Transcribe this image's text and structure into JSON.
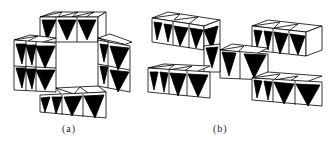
{
  "figure": {
    "panels": [
      {
        "id": "a",
        "caption": "(a)",
        "description": "Ring of edge/corner-sharing octahedra enclosing a square tunnel",
        "colors": {
          "dark_face": "#000000",
          "light_face": "#ffffff",
          "edge": "#000000"
        }
      },
      {
        "id": "b",
        "caption": "(b)",
        "description": "Four layered octahedral slabs linked by a central chain of octahedra",
        "colors": {
          "dark_face": "#000000",
          "light_face": "#ffffff",
          "edge": "#000000"
        }
      }
    ]
  }
}
